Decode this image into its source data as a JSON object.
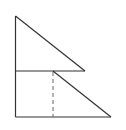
{
  "diagram": {
    "colors": {
      "stroke": "#333333",
      "dashed": "#666666",
      "background": "#ffffff"
    },
    "points": {
      "top": [
        15.5,
        16
      ],
      "mid_left": [
        15.5,
        71
      ],
      "mid_right": [
        85,
        71
      ],
      "apex_lower": [
        53,
        71
      ],
      "bottom_left": [
        15.5,
        117
      ],
      "bottom_right": [
        111,
        117
      ],
      "dash_foot": [
        53,
        117
      ]
    }
  }
}
